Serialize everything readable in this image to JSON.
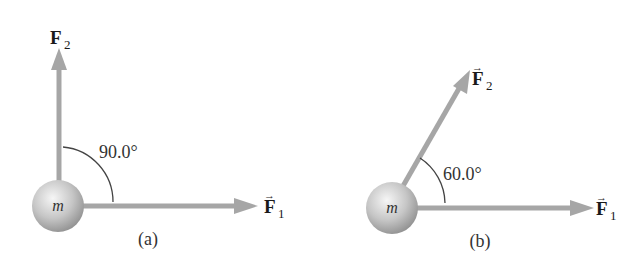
{
  "colors": {
    "background": "#ffffff",
    "arrow": "#a6a6a6",
    "arc": "#444444",
    "text": "#1a1a1a",
    "sphere_light": "#f4f4f4",
    "sphere_mid": "#c4c4c4",
    "sphere_dark": "#8f8f8f"
  },
  "panels": [
    {
      "id": "a",
      "caption": "(a)",
      "mass_label": "m",
      "angle_label": "90.0°",
      "angle_deg": 90.0,
      "forces": [
        {
          "name": "F",
          "subscript": "1",
          "vector_arrow": "→",
          "direction_deg": 0
        },
        {
          "name": "F",
          "subscript": "2",
          "vector_arrow": "→",
          "direction_deg": 90
        }
      ]
    },
    {
      "id": "b",
      "caption": "(b)",
      "mass_label": "m",
      "angle_label": "60.0°",
      "angle_deg": 60.0,
      "forces": [
        {
          "name": "F",
          "subscript": "1",
          "vector_arrow": "→",
          "direction_deg": 0
        },
        {
          "name": "F",
          "subscript": "2",
          "vector_arrow": "→",
          "direction_deg": 60
        }
      ]
    }
  ]
}
